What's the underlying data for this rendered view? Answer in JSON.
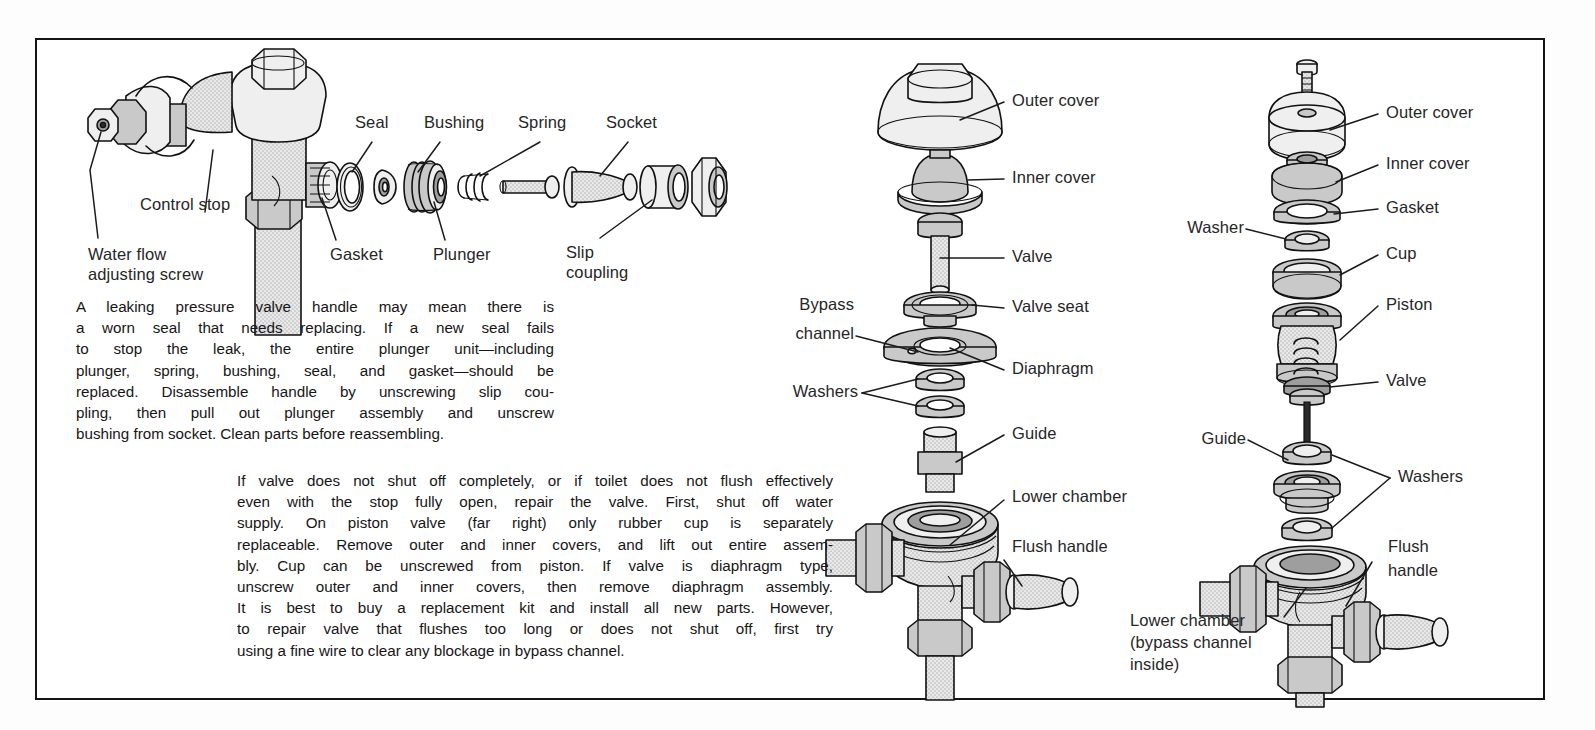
{
  "figure": {
    "frame_color": "#141414",
    "ink_color": "#1a1a1a",
    "fill_gray": "#d8d8d8",
    "fill_mid_gray": "#c9c9c9",
    "fill_dark_gray": "#9e9e9e"
  },
  "handle_assembly": {
    "labels": {
      "control_stop": "Control stop",
      "water_flow_screw_line1": "Water flow",
      "water_flow_screw_line2": "adjusting screw",
      "gasket": "Gasket",
      "seal": "Seal",
      "bushing": "Bushing",
      "plunger": "Plunger",
      "spring": "Spring",
      "socket": "Socket",
      "slip_coupling_line1": "Slip",
      "slip_coupling_line2": "coupling"
    }
  },
  "diaphragm_valve": {
    "labels": {
      "outer_cover": "Outer cover",
      "inner_cover": "Inner cover",
      "valve": "Valve",
      "valve_seat": "Valve seat",
      "bypass_channel_line1": "Bypass",
      "bypass_channel_line2": "channel",
      "diaphragm": "Diaphragm",
      "washers": "Washers",
      "guide": "Guide",
      "lower_chamber": "Lower chamber",
      "flush_handle": "Flush handle"
    }
  },
  "piston_valve": {
    "labels": {
      "outer_cover": "Outer cover",
      "inner_cover": "Inner cover",
      "gasket": "Gasket",
      "washer": "Washer",
      "cup": "Cup",
      "piston": "Piston",
      "valve": "Valve",
      "guide": "Guide",
      "washers": "Washers",
      "flush_handle_line1": "Flush",
      "flush_handle_line2": "handle",
      "lower_chamber_line1": "Lower chamber",
      "lower_chamber_line2": "(bypass channel",
      "lower_chamber_line3": "inside)"
    }
  },
  "body_text": {
    "handle_paragraph_lines": [
      "A leaking pressure valve handle may mean there is",
      "a worn seal that needs replacing. If a new seal fails",
      "to stop the leak, the entire plunger unit—including",
      "plunger, spring, bushing, seal, and gasket—should be",
      "replaced. Disassemble handle by unscrewing slip cou-",
      "pling, then pull out plunger assembly and unscrew",
      "bushing from socket. Clean parts before reassembling."
    ],
    "valve_paragraph_lines": [
      "If valve does not shut off completely, or if toilet does not flush effectively",
      "even with the stop fully open, repair the valve. First, shut off water",
      "supply. On piston valve (far right) only rubber cup is separately",
      "replaceable. Remove outer and inner covers, and lift out entire assem-",
      "bly. Cup can be unscrewed from piston. If valve is diaphragm type,",
      "unscrew outer and inner covers, then remove diaphragm assembly.",
      "It is best to buy a replacement kit and install all new parts. However,",
      "to repair valve that flushes too long or does not shut off, first try",
      "using a fine wire to clear any blockage in bypass channel."
    ]
  }
}
